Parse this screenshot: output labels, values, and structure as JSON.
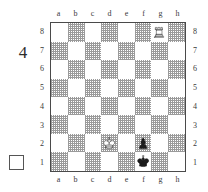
{
  "diagram": {
    "puzzle_number": "4",
    "side_to_move_indicator": "white-empty-square",
    "files_top": [
      "a",
      "b",
      "c",
      "d",
      "e",
      "f",
      "g",
      "h"
    ],
    "files_bottom": [
      "a",
      "b",
      "c",
      "d",
      "e",
      "f",
      "g",
      "h"
    ],
    "ranks_left": [
      "8",
      "7",
      "6",
      "5",
      "4",
      "3",
      "2",
      "1"
    ],
    "ranks_right": [
      "8",
      "7",
      "6",
      "5",
      "4",
      "3",
      "2",
      "1"
    ],
    "colors": {
      "light_square": "#ffffff",
      "dark_square": "#b8b8b8",
      "border": "#4a4a4a",
      "white_piece_fill": "#ffffff",
      "white_piece_stroke": "#3a3a3a",
      "black_piece_fill": "#1d1d1d"
    }
  },
  "chart_data": {
    "type": "table",
    "board": {
      "files": [
        "a",
        "b",
        "c",
        "d",
        "e",
        "f",
        "g",
        "h"
      ],
      "ranks": [
        "8",
        "7",
        "6",
        "5",
        "4",
        "3",
        "2",
        "1"
      ],
      "orientation": "white-bottom",
      "a8_square_color": "light"
    },
    "pieces": [
      {
        "square": "g8",
        "color": "white",
        "type": "rook",
        "glyph": "♖"
      },
      {
        "square": "d2",
        "color": "white",
        "type": "king",
        "glyph": "♔"
      },
      {
        "square": "f2",
        "color": "black",
        "type": "pawn",
        "glyph": "♟"
      },
      {
        "square": "f1",
        "color": "black",
        "type": "king",
        "glyph": "♚"
      }
    ],
    "piece_count": 4,
    "side_to_move": "white",
    "rows": [
      [
        "",
        "",
        "",
        "",
        "",
        "",
        "wR",
        ""
      ],
      [
        "",
        "",
        "",
        "",
        "",
        "",
        "",
        ""
      ],
      [
        "",
        "",
        "",
        "",
        "",
        "",
        "",
        ""
      ],
      [
        "",
        "",
        "",
        "",
        "",
        "",
        "",
        ""
      ],
      [
        "",
        "",
        "",
        "",
        "",
        "",
        "",
        ""
      ],
      [
        "",
        "",
        "",
        "",
        "",
        "",
        "",
        ""
      ],
      [
        "",
        "",
        "",
        "wK",
        "",
        "bP",
        "",
        ""
      ],
      [
        "",
        "",
        "",
        "",
        "",
        "bK",
        "",
        ""
      ]
    ]
  }
}
